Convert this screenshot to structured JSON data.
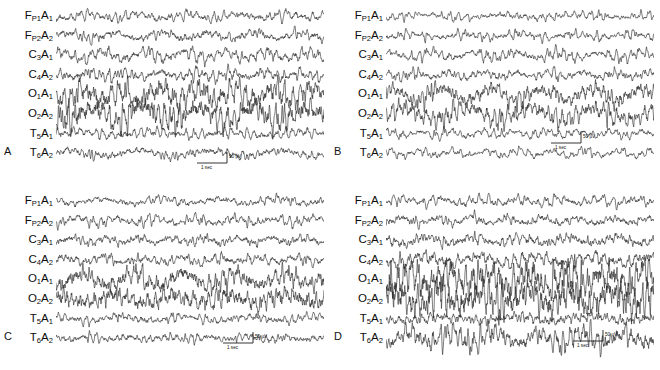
{
  "figure": {
    "type": "eeg-multichannel-recording",
    "panel_count": 4,
    "background_color": "#ffffff",
    "trace_color": "#2a2a2a",
    "width": 660,
    "height": 370
  },
  "channels": [
    {
      "id": "fp1a1",
      "site": "F",
      "site_sub": "P1",
      "ref": "A",
      "ref_sub": "1",
      "text": "FP1A1"
    },
    {
      "id": "fp2a2",
      "site": "F",
      "site_sub": "P2",
      "ref": "A",
      "ref_sub": "2",
      "text": "FP2A2"
    },
    {
      "id": "c3a1",
      "site": "C",
      "site_sub": "3",
      "ref": "A",
      "ref_sub": "1",
      "text": "C3A1"
    },
    {
      "id": "c4a2",
      "site": "C",
      "site_sub": "4",
      "ref": "A",
      "ref_sub": "2",
      "text": "C4A2"
    },
    {
      "id": "o1a1",
      "site": "O",
      "site_sub": "1",
      "ref": "A",
      "ref_sub": "1",
      "text": "O1A1"
    },
    {
      "id": "o2a2",
      "site": "O",
      "site_sub": "2",
      "ref": "A",
      "ref_sub": "2",
      "text": "O2A2"
    },
    {
      "id": "t5a1",
      "site": "T",
      "site_sub": "5",
      "ref": "A",
      "ref_sub": "1",
      "text": "T5A1"
    },
    {
      "id": "t6a2",
      "site": "T",
      "site_sub": "6",
      "ref": "A",
      "ref_sub": "2",
      "text": "T6A2"
    }
  ],
  "scale_bar": {
    "amplitude_label": "50 µV",
    "time_label": "1 sec",
    "amplitude_value": 50,
    "amplitude_unit": "µV",
    "time_value": 1,
    "time_unit": "sec"
  },
  "panels": [
    {
      "letter": "A",
      "key": "a",
      "scalebar_x": 196,
      "scalebar_y": 150,
      "channel_traces": [
        {
          "id": "fp1a1",
          "amp": 3.2,
          "freq": 9.0,
          "noise": 1.5,
          "seed": 11
        },
        {
          "id": "fp2a2",
          "amp": 3.4,
          "freq": 8.4,
          "noise": 1.5,
          "seed": 23
        },
        {
          "id": "c3a1",
          "amp": 3.6,
          "freq": 9.6,
          "noise": 1.6,
          "seed": 37
        },
        {
          "id": "c4a2",
          "amp": 3.8,
          "freq": 9.2,
          "noise": 1.6,
          "seed": 41
        },
        {
          "id": "o1a1",
          "amp": 8.2,
          "freq": 10.6,
          "noise": 1.8,
          "seed": 59
        },
        {
          "id": "o2a2",
          "amp": 8.6,
          "freq": 10.2,
          "noise": 1.8,
          "seed": 67
        },
        {
          "id": "t5a1",
          "amp": 3.0,
          "freq": 10.0,
          "noise": 1.6,
          "seed": 73
        },
        {
          "id": "t6a2",
          "amp": 3.2,
          "freq": 9.4,
          "noise": 1.5,
          "seed": 89
        }
      ]
    },
    {
      "letter": "B",
      "key": "b",
      "scalebar_x": 550,
      "scalebar_y": 130,
      "channel_traces": [
        {
          "id": "fp1a1",
          "amp": 2.6,
          "freq": 11.0,
          "noise": 1.4,
          "seed": 101
        },
        {
          "id": "fp2a2",
          "amp": 2.8,
          "freq": 10.4,
          "noise": 1.4,
          "seed": 113
        },
        {
          "id": "c3a1",
          "amp": 3.0,
          "freq": 11.6,
          "noise": 1.5,
          "seed": 127
        },
        {
          "id": "c4a2",
          "amp": 3.2,
          "freq": 11.0,
          "noise": 1.5,
          "seed": 139
        },
        {
          "id": "o1a1",
          "amp": 6.0,
          "freq": 12.4,
          "noise": 1.6,
          "seed": 151
        },
        {
          "id": "o2a2",
          "amp": 6.4,
          "freq": 12.0,
          "noise": 1.6,
          "seed": 163
        },
        {
          "id": "t5a1",
          "amp": 2.6,
          "freq": 11.4,
          "noise": 1.5,
          "seed": 173
        },
        {
          "id": "t6a2",
          "amp": 2.8,
          "freq": 11.0,
          "noise": 1.4,
          "seed": 191
        }
      ]
    },
    {
      "letter": "C",
      "key": "c",
      "scalebar_x": 222,
      "scalebar_y": 330,
      "channel_traces": [
        {
          "id": "fp1a1",
          "amp": 2.8,
          "freq": 10.4,
          "noise": 1.5,
          "seed": 211
        },
        {
          "id": "fp2a2",
          "amp": 3.0,
          "freq": 10.0,
          "noise": 1.5,
          "seed": 223
        },
        {
          "id": "c3a1",
          "amp": 3.2,
          "freq": 11.2,
          "noise": 1.6,
          "seed": 233
        },
        {
          "id": "c4a2",
          "amp": 3.4,
          "freq": 10.6,
          "noise": 1.6,
          "seed": 241
        },
        {
          "id": "o1a1",
          "amp": 6.6,
          "freq": 12.0,
          "noise": 1.7,
          "seed": 257
        },
        {
          "id": "o2a2",
          "amp": 7.0,
          "freq": 11.6,
          "noise": 1.7,
          "seed": 269
        },
        {
          "id": "t5a1",
          "amp": 2.8,
          "freq": 11.0,
          "noise": 1.5,
          "seed": 277
        },
        {
          "id": "t6a2",
          "amp": 3.0,
          "freq": 10.8,
          "noise": 1.5,
          "seed": 283
        }
      ]
    },
    {
      "letter": "D",
      "key": "d",
      "scalebar_x": 572,
      "scalebar_y": 328,
      "channel_traces": [
        {
          "id": "fp1a1",
          "amp": 3.0,
          "freq": 10.0,
          "noise": 1.6,
          "seed": 307
        },
        {
          "id": "fp2a2",
          "amp": 3.2,
          "freq": 9.6,
          "noise": 1.6,
          "seed": 317
        },
        {
          "id": "c3a1",
          "amp": 3.6,
          "freq": 10.8,
          "noise": 1.7,
          "seed": 331
        },
        {
          "id": "c4a2",
          "amp": 4.0,
          "freq": 10.2,
          "noise": 1.7,
          "seed": 347
        },
        {
          "id": "o1a1",
          "amp": 11.0,
          "freq": 12.8,
          "noise": 1.9,
          "seed": 359
        },
        {
          "id": "o2a2",
          "amp": 11.4,
          "freq": 12.4,
          "noise": 1.9,
          "seed": 367
        },
        {
          "id": "t5a1",
          "amp": 3.4,
          "freq": 11.4,
          "noise": 1.7,
          "seed": 379
        },
        {
          "id": "t6a2",
          "amp": 6.2,
          "freq": 12.0,
          "noise": 1.8,
          "seed": 389
        }
      ]
    }
  ]
}
